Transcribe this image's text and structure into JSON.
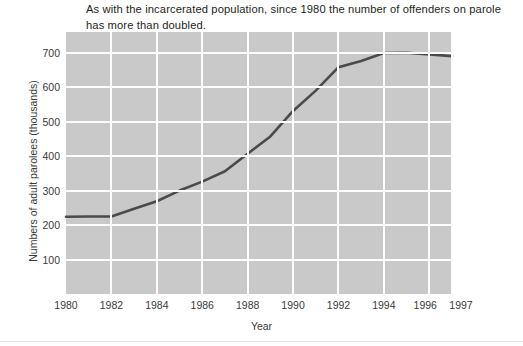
{
  "caption": {
    "text": "As with the incarcerated population, since 1980 the number of offenders on parole has more than doubled."
  },
  "chart_data": {
    "type": "line",
    "title": "",
    "xlabel": "Year",
    "ylabel": "Numbers of adult parolees (thousands)",
    "x": [
      1980,
      1981,
      1982,
      1983,
      1984,
      1985,
      1986,
      1987,
      1988,
      1989,
      1990,
      1991,
      1992,
      1993,
      1994,
      1995,
      1996,
      1997
    ],
    "values": [
      224,
      225,
      225,
      247,
      269,
      300,
      326,
      356,
      407,
      457,
      531,
      590,
      658,
      676,
      699,
      700,
      695,
      690
    ],
    "series": [
      {
        "name": "Adult parolees",
        "values": [
          224,
          225,
          225,
          247,
          269,
          300,
          326,
          356,
          407,
          457,
          531,
          590,
          658,
          676,
          699,
          700,
          695,
          690
        ]
      }
    ],
    "xlim": [
      1980,
      1997
    ],
    "ylim": [
      0,
      760
    ],
    "xticks": [
      1980,
      1982,
      1984,
      1986,
      1988,
      1990,
      1992,
      1994,
      1996,
      1997
    ],
    "xtick_labels": [
      "1980",
      "1982",
      "1984",
      "1986",
      "1988",
      "1990",
      "1992",
      "1994",
      "1996",
      "1997"
    ],
    "yticks": [
      100,
      200,
      300,
      400,
      500,
      600,
      700
    ],
    "ytick_labels": [
      "100",
      "200",
      "300",
      "400",
      "500",
      "600",
      "700"
    ],
    "grid": true,
    "legend": "none",
    "colors": {
      "plot_background": "#c9c9c9",
      "gridline": "#fdfdfd",
      "line": "#4a4a4a",
      "text": "#3a3a3a",
      "caption_text": "#231f20"
    },
    "line_width": 2.6
  }
}
